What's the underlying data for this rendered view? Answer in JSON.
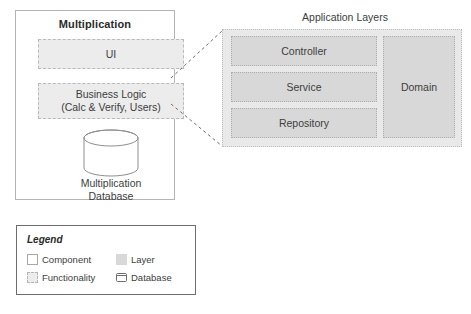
{
  "diagram": {
    "component": {
      "title": "Multiplication",
      "functionalities": [
        {
          "label": "UI",
          "sublabel": ""
        },
        {
          "label": "Business Logic",
          "sublabel": "(Calc & Verify, Users)"
        }
      ],
      "database": {
        "name": "Multiplication",
        "name_line2": "Database",
        "icon": "database-cylinder-icon"
      }
    },
    "app_layers": {
      "title": "Application Layers",
      "layers": [
        {
          "label": "Controller"
        },
        {
          "label": "Service"
        },
        {
          "label": "Repository"
        },
        {
          "label": "Domain"
        }
      ]
    },
    "legend": {
      "title": "Legend",
      "items": [
        {
          "label": "Component",
          "swatch": "component-swatch"
        },
        {
          "label": "Functionality",
          "swatch": "functionality-swatch"
        },
        {
          "label": "Layer",
          "swatch": "layer-swatch"
        },
        {
          "label": "Database",
          "swatch": "database-swatch"
        }
      ]
    },
    "colors": {
      "background": "#ffffff",
      "component_border": "#b4b4b4",
      "functionality_fill": "#ececec",
      "functionality_border": "#b9b9b9",
      "layer_fill": "#d8d8d8",
      "layer_border": "#adadad",
      "container_fill": "#e9e9e9",
      "container_border": "#bdbdbd",
      "legend_border": "#6d6d6d",
      "text": "#3d3d3d",
      "connector": "#6d6d6d"
    }
  }
}
